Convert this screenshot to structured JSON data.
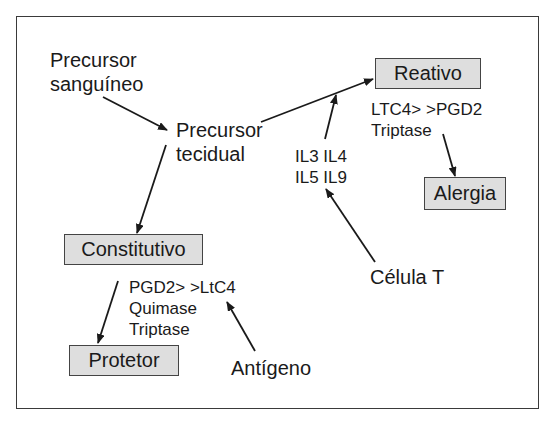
{
  "diagram": {
    "nodes": {
      "precursor_sanguineo": {
        "line1": "Precursor",
        "line2": "sanguíneo"
      },
      "precursor_tecidual": {
        "line1": "Precursor",
        "line2": "tecidual"
      },
      "reativo": {
        "label": "Reativo"
      },
      "constitutivo": {
        "label": "Constitutivo"
      },
      "protetor": {
        "label": "Protetor"
      },
      "alergia": {
        "label": "Alergia"
      },
      "celula_t": {
        "label": "Célula T"
      },
      "antigeno": {
        "label": "Antígeno"
      }
    },
    "annotations": {
      "interleukins": {
        "line1": "IL3 IL4",
        "line2": "IL5 IL9"
      },
      "reativo_mediators": {
        "line1": "LTC4> >PGD2",
        "line2": "Triptase"
      },
      "constitutivo_mediators": {
        "line1": "PGD2> >LtC4",
        "line2": "Quimase",
        "line3": "Triptase"
      }
    },
    "edges": [
      {
        "from": "Precursor sanguíneo",
        "to": "Precursor tecidual"
      },
      {
        "from": "Precursor tecidual",
        "to": "Reativo"
      },
      {
        "from": "Precursor tecidual",
        "to": "Constitutivo"
      },
      {
        "from": "IL3 IL4 IL5 IL9",
        "to": "Precursor tecidual → Reativo"
      },
      {
        "from": "Célula T",
        "to": "IL3 IL4 IL5 IL9"
      },
      {
        "from": "Reativo mediators",
        "to": "Alergia"
      },
      {
        "from": "Constitutivo",
        "to": "Protetor"
      },
      {
        "from": "Antígeno",
        "to": "Constitutivo mediators"
      }
    ],
    "colors": {
      "box_fill": "#dedede",
      "box_border": "#444444",
      "line": "#1a1a1a"
    }
  }
}
